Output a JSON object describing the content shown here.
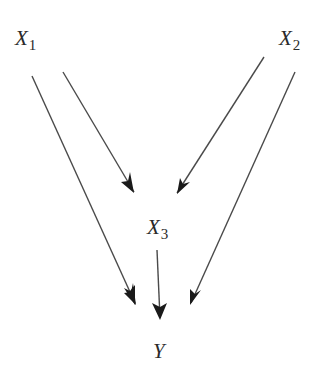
{
  "diagram": {
    "type": "causal-dag",
    "nodes": [
      {
        "id": "X1",
        "base": "X",
        "sub": "1"
      },
      {
        "id": "X2",
        "base": "X",
        "sub": "2"
      },
      {
        "id": "X3",
        "base": "X",
        "sub": "3"
      },
      {
        "id": "Y",
        "base": "Y",
        "sub": ""
      }
    ],
    "edges": [
      {
        "from": "X1",
        "to": "X3"
      },
      {
        "from": "X1",
        "to": "Y"
      },
      {
        "from": "X2",
        "to": "X3"
      },
      {
        "from": "X2",
        "to": "Y"
      },
      {
        "from": "X3",
        "to": "Y"
      }
    ],
    "colors": {
      "line": "#4a4a4a",
      "arrowhead": "#1a1a1a",
      "text": "#2a2a2a",
      "background": "#ffffff"
    }
  }
}
